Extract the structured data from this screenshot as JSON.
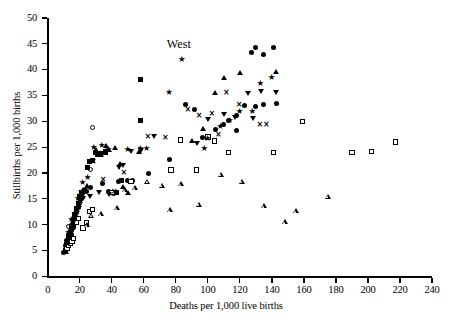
{
  "chart_data": {
    "type": "scatter",
    "title": "",
    "annotation": "West",
    "xlabel": "Deaths per 1,000 live births",
    "ylabel": "Stillbirths per 1,000 births",
    "xlim": [
      0,
      240
    ],
    "ylim": [
      0,
      50
    ],
    "xticks": [
      0,
      20,
      40,
      60,
      80,
      100,
      120,
      140,
      160,
      180,
      200,
      220,
      240
    ],
    "yticks": [
      0,
      5,
      10,
      15,
      20,
      25,
      30,
      35,
      40,
      45,
      50
    ],
    "grid": false,
    "legend": "none",
    "series": [
      {
        "name": "filled-circle",
        "marker": "filled-circle",
        "points": [
          [
            10,
            4.6
          ],
          [
            11,
            5.2
          ],
          [
            11,
            6.0
          ],
          [
            12,
            5.6
          ],
          [
            12,
            7.0
          ],
          [
            13,
            6.4
          ],
          [
            13,
            7.6
          ],
          [
            14,
            7.2
          ],
          [
            14,
            8.6
          ],
          [
            15,
            8.0
          ],
          [
            16,
            9.4
          ],
          [
            16,
            10.8
          ],
          [
            17,
            11.6
          ],
          [
            18,
            12.4
          ],
          [
            19,
            13.4
          ],
          [
            20,
            14.2
          ],
          [
            21,
            15.0
          ],
          [
            22,
            16.0
          ],
          [
            24,
            16.4
          ],
          [
            27,
            17.2
          ],
          [
            34,
            18.0
          ],
          [
            38,
            16.4
          ],
          [
            41,
            16.0
          ],
          [
            44,
            18.4
          ],
          [
            50,
            18.6
          ],
          [
            53,
            18.6
          ],
          [
            63,
            19.8
          ],
          [
            76,
            22.6
          ],
          [
            86,
            33.2
          ],
          [
            92,
            32.2
          ],
          [
            97,
            26.8
          ],
          [
            105,
            28.4
          ],
          [
            110,
            29.4
          ],
          [
            113,
            30.2
          ],
          [
            118,
            28.2
          ],
          [
            123,
            33.0
          ],
          [
            127,
            43.4
          ],
          [
            130,
            44.2
          ],
          [
            135,
            43.0
          ],
          [
            141,
            44.2
          ],
          [
            130,
            32.8
          ],
          [
            135,
            33.2
          ],
          [
            143,
            33.4
          ],
          [
            118,
            31.2
          ]
        ]
      },
      {
        "name": "open-circle",
        "marker": "open-circle",
        "points": [
          [
            13,
            9.6
          ],
          [
            16,
            11.0
          ],
          [
            20,
            14.0
          ],
          [
            27,
            20.6
          ],
          [
            28,
            28.8
          ]
        ]
      },
      {
        "name": "filled-square",
        "marker": "filled-square",
        "points": [
          [
            11,
            5.0
          ],
          [
            12,
            6.2
          ],
          [
            13,
            7.8
          ],
          [
            14,
            8.4
          ],
          [
            15,
            9.2
          ],
          [
            16,
            10.2
          ],
          [
            17,
            12.0
          ],
          [
            18,
            13.2
          ],
          [
            19,
            14.0
          ],
          [
            20,
            15.4
          ],
          [
            21,
            16.2
          ],
          [
            23,
            16.6
          ],
          [
            25,
            21.0
          ],
          [
            26,
            22.2
          ],
          [
            28,
            22.4
          ],
          [
            31,
            23.6
          ],
          [
            33,
            23.8
          ],
          [
            36,
            24.0
          ],
          [
            43,
            16.2
          ],
          [
            46,
            18.6
          ],
          [
            52,
            18.4
          ],
          [
            58,
            30.2
          ],
          [
            58,
            38.0
          ],
          [
            36,
            24.2
          ],
          [
            30,
            24.0
          ]
        ]
      },
      {
        "name": "open-square",
        "marker": "open-square",
        "points": [
          [
            12,
            5.4
          ],
          [
            13,
            6.0
          ],
          [
            14,
            6.4
          ],
          [
            15,
            6.8
          ],
          [
            16,
            7.4
          ],
          [
            18,
            10.4
          ],
          [
            19,
            11.2
          ],
          [
            22,
            9.4
          ],
          [
            24,
            10.4
          ],
          [
            26,
            12.6
          ],
          [
            28,
            13.0
          ],
          [
            40,
            16.2
          ],
          [
            52,
            18.4
          ],
          [
            77,
            20.6
          ],
          [
            83,
            26.4
          ],
          [
            93,
            20.6
          ],
          [
            100,
            27.0
          ],
          [
            104,
            26.2
          ],
          [
            113,
            24.0
          ],
          [
            141,
            24.0
          ],
          [
            190,
            24.0
          ],
          [
            202,
            24.2
          ],
          [
            217,
            26.0
          ],
          [
            159,
            30.0
          ]
        ]
      },
      {
        "name": "filled-tri-up",
        "marker": "filled-tri-up",
        "points": [
          [
            11,
            4.8
          ],
          [
            12,
            6.6
          ],
          [
            13,
            8.0
          ],
          [
            14,
            9.0
          ],
          [
            15,
            10.4
          ],
          [
            16,
            11.4
          ],
          [
            17,
            12.2
          ],
          [
            18,
            13.0
          ],
          [
            19,
            13.8
          ],
          [
            20,
            14.6
          ],
          [
            21,
            15.4
          ],
          [
            22,
            16.8
          ],
          [
            24,
            17.6
          ],
          [
            30,
            24.6
          ],
          [
            33,
            23.6
          ],
          [
            36,
            25.4
          ],
          [
            38,
            24.6
          ],
          [
            42,
            25.0
          ],
          [
            45,
            21.8
          ],
          [
            47,
            17.4
          ],
          [
            50,
            16.2
          ],
          [
            90,
            26.2
          ],
          [
            97,
            28.6
          ],
          [
            104,
            35.6
          ],
          [
            110,
            38.4
          ],
          [
            120,
            39.4
          ],
          [
            142,
            39.6
          ],
          [
            57,
            24.2
          ]
        ]
      },
      {
        "name": "open-tri-up",
        "marker": "open-tri-up",
        "points": [
          [
            24,
            10.0
          ],
          [
            27,
            12.8
          ],
          [
            33,
            14.0
          ],
          [
            43,
            16.2
          ],
          [
            48,
            20.6
          ],
          [
            54,
            22.0
          ],
          [
            62,
            24.2
          ],
          [
            71,
            24.4
          ],
          [
            76,
            20.6
          ],
          [
            83,
            26.6
          ],
          [
            94,
            23.6
          ],
          [
            108,
            30.4
          ],
          [
            121,
            30.0
          ],
          [
            135,
            26.2
          ],
          [
            155,
            26.2
          ],
          [
            175,
            30.0
          ],
          [
            148,
            26.0
          ]
        ]
      },
      {
        "name": "filled-tri-down",
        "marker": "filled-tri-down",
        "points": [
          [
            14,
            8.4
          ],
          [
            16,
            10.6
          ],
          [
            18,
            13.0
          ],
          [
            20,
            14.4
          ],
          [
            22,
            15.0
          ],
          [
            26,
            15.4
          ],
          [
            32,
            16.2
          ],
          [
            38,
            15.8
          ],
          [
            44,
            21.0
          ],
          [
            47,
            21.4
          ],
          [
            52,
            24.2
          ],
          [
            58,
            24.4
          ],
          [
            66,
            27.0
          ],
          [
            93,
            25.6
          ],
          [
            100,
            30.4
          ],
          [
            110,
            31.4
          ],
          [
            125,
            35.4
          ],
          [
            133,
            35.8
          ],
          [
            142,
            35.6
          ],
          [
            117,
            30.8
          ],
          [
            128,
            30.6
          ]
        ]
      },
      {
        "name": "star",
        "marker": "star",
        "points": [
          [
            13,
            8.2
          ],
          [
            15,
            10.6
          ],
          [
            17,
            11.8
          ],
          [
            19,
            14.8
          ],
          [
            22,
            17.8
          ],
          [
            25,
            18.8
          ],
          [
            29,
            24.6
          ],
          [
            34,
            25.0
          ],
          [
            38,
            24.2
          ],
          [
            50,
            24.2
          ],
          [
            58,
            24.4
          ],
          [
            76,
            35.2
          ],
          [
            84,
            41.6
          ],
          [
            100,
            26.4
          ],
          [
            108,
            28.6
          ],
          [
            114,
            29.8
          ],
          [
            120,
            31.6
          ],
          [
            128,
            31.6
          ],
          [
            140,
            38.2
          ],
          [
            133,
            37.0
          ],
          [
            98,
            24.4
          ],
          [
            62,
            24.4
          ]
        ]
      },
      {
        "name": "cross",
        "marker": "cross",
        "points": [
          [
            15,
            9.0
          ],
          [
            18,
            12.2
          ],
          [
            21,
            15.8
          ],
          [
            24,
            16.2
          ],
          [
            29,
            21.8
          ],
          [
            35,
            18.4
          ],
          [
            42,
            16.0
          ],
          [
            48,
            19.8
          ],
          [
            63,
            26.8
          ],
          [
            74,
            26.6
          ],
          [
            88,
            32.0
          ],
          [
            95,
            30.8
          ],
          [
            103,
            31.2
          ],
          [
            112,
            35.2
          ],
          [
            120,
            32.8
          ],
          [
            133,
            29.0
          ],
          [
            137,
            29.0
          ],
          [
            107,
            27.0
          ]
        ]
      }
    ]
  }
}
